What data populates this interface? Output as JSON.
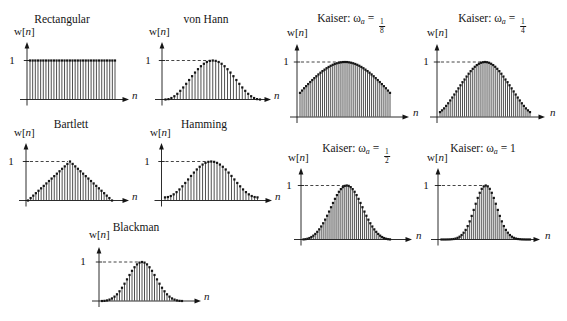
{
  "figure": {
    "background_color": "#ffffff",
    "ink_color": "#151515"
  },
  "chart_data": [
    {
      "id": "rectangular",
      "type": "stem",
      "title": {
        "pre": "Rectangular",
        "sub": "",
        "post": "",
        "frac_num": "",
        "frac_den": ""
      },
      "ylabel": {
        "pre": "w[",
        "var": "n",
        "post": "]"
      },
      "xlabel": "n",
      "ytick": "1",
      "ylim": [
        0,
        1
      ],
      "n_points": 33,
      "values": [
        1,
        1,
        1,
        1,
        1,
        1,
        1,
        1,
        1,
        1,
        1,
        1,
        1,
        1,
        1,
        1,
        1,
        1,
        1,
        1,
        1,
        1,
        1,
        1,
        1,
        1,
        1,
        1,
        1,
        1,
        1,
        1,
        1
      ]
    },
    {
      "id": "von-hann",
      "type": "stem",
      "title": {
        "pre": "von Hann",
        "sub": "",
        "post": "",
        "frac_num": "",
        "frac_den": ""
      },
      "ylabel": {
        "pre": "w[",
        "var": "n",
        "post": "]"
      },
      "xlabel": "n",
      "ytick": "1",
      "ylim": [
        0,
        1
      ],
      "n_points": 33,
      "values": [
        0,
        0.01,
        0.038,
        0.084,
        0.146,
        0.222,
        0.309,
        0.402,
        0.5,
        0.598,
        0.691,
        0.778,
        0.854,
        0.916,
        0.962,
        0.99,
        1,
        0.99,
        0.962,
        0.916,
        0.854,
        0.778,
        0.691,
        0.598,
        0.5,
        0.402,
        0.309,
        0.222,
        0.146,
        0.084,
        0.038,
        0.01,
        0
      ]
    },
    {
      "id": "kaiser-1-8",
      "type": "stem",
      "title": {
        "pre": "Kaiser: ω",
        "sub": "a",
        "post": " = ",
        "frac_num": "1",
        "frac_den": "8"
      },
      "ylabel": {
        "pre": "w[",
        "var": "n",
        "post": "]"
      },
      "xlabel": "n",
      "ytick": "1",
      "ylim": [
        0,
        1
      ],
      "n_points": 45,
      "values": [
        0.439,
        0.481,
        0.523,
        0.561,
        0.599,
        0.636,
        0.672,
        0.707,
        0.741,
        0.774,
        0.805,
        0.835,
        0.861,
        0.887,
        0.91,
        0.931,
        0.949,
        0.964,
        0.977,
        0.987,
        0.994,
        0.999,
        1,
        0.999,
        0.994,
        0.987,
        0.977,
        0.964,
        0.949,
        0.931,
        0.91,
        0.887,
        0.861,
        0.835,
        0.805,
        0.774,
        0.741,
        0.707,
        0.672,
        0.636,
        0.599,
        0.561,
        0.523,
        0.481,
        0.439
      ]
    },
    {
      "id": "kaiser-1-4",
      "type": "stem",
      "title": {
        "pre": "Kaiser: ω",
        "sub": "a",
        "post": " = ",
        "frac_num": "1",
        "frac_den": "4"
      },
      "ylabel": {
        "pre": "w[",
        "var": "n",
        "post": "]"
      },
      "xlabel": "n",
      "ytick": "1",
      "ylim": [
        0,
        1
      ],
      "n_points": 45,
      "values": [
        0.089,
        0.121,
        0.157,
        0.202,
        0.25,
        0.301,
        0.354,
        0.409,
        0.465,
        0.521,
        0.577,
        0.633,
        0.682,
        0.736,
        0.787,
        0.834,
        0.876,
        0.913,
        0.944,
        0.968,
        0.986,
        0.996,
        1,
        0.996,
        0.986,
        0.968,
        0.944,
        0.913,
        0.876,
        0.834,
        0.787,
        0.736,
        0.682,
        0.633,
        0.577,
        0.521,
        0.465,
        0.409,
        0.354,
        0.301,
        0.25,
        0.202,
        0.157,
        0.121,
        0.089
      ]
    },
    {
      "id": "bartlett",
      "type": "stem",
      "title": {
        "pre": "Bartlett",
        "sub": "",
        "post": "",
        "frac_num": "",
        "frac_den": ""
      },
      "ylabel": {
        "pre": "w[",
        "var": "n",
        "post": "]"
      },
      "xlabel": "n",
      "ytick": "1",
      "ylim": [
        0,
        1
      ],
      "n_points": 33,
      "values": [
        0,
        0.063,
        0.125,
        0.188,
        0.25,
        0.313,
        0.375,
        0.438,
        0.5,
        0.563,
        0.625,
        0.688,
        0.75,
        0.813,
        0.875,
        0.938,
        1,
        0.938,
        0.875,
        0.813,
        0.75,
        0.688,
        0.625,
        0.563,
        0.5,
        0.438,
        0.375,
        0.313,
        0.25,
        0.188,
        0.125,
        0.063,
        0
      ]
    },
    {
      "id": "hamming",
      "type": "stem",
      "title": {
        "pre": "Hamming",
        "sub": "",
        "post": "",
        "frac_num": "",
        "frac_den": ""
      },
      "ylabel": {
        "pre": "w[",
        "var": "n",
        "post": "]"
      },
      "xlabel": "n",
      "ytick": "1",
      "ylim": [
        0,
        1
      ],
      "n_points": 33,
      "values": [
        0.08,
        0.089,
        0.115,
        0.158,
        0.215,
        0.284,
        0.364,
        0.45,
        0.54,
        0.63,
        0.716,
        0.796,
        0.865,
        0.922,
        0.965,
        0.991,
        1,
        0.991,
        0.965,
        0.922,
        0.865,
        0.796,
        0.716,
        0.63,
        0.54,
        0.45,
        0.364,
        0.284,
        0.215,
        0.158,
        0.115,
        0.089,
        0.08
      ]
    },
    {
      "id": "kaiser-1-2",
      "type": "stem",
      "title": {
        "pre": "Kaiser: ω",
        "sub": "a",
        "post": " = ",
        "frac_num": "1",
        "frac_den": "2"
      },
      "ylabel": {
        "pre": "w[",
        "var": "n",
        "post": "]"
      },
      "xlabel": "n",
      "ytick": "1",
      "ylim": [
        0,
        1
      ],
      "n_points": 45,
      "values": [
        0.002,
        0.006,
        0.014,
        0.027,
        0.046,
        0.071,
        0.103,
        0.142,
        0.188,
        0.241,
        0.301,
        0.368,
        0.44,
        0.517,
        0.598,
        0.677,
        0.753,
        0.823,
        0.884,
        0.933,
        0.97,
        0.993,
        1,
        0.993,
        0.97,
        0.933,
        0.884,
        0.823,
        0.753,
        0.677,
        0.598,
        0.517,
        0.44,
        0.368,
        0.301,
        0.241,
        0.188,
        0.142,
        0.103,
        0.071,
        0.046,
        0.027,
        0.014,
        0.006,
        0.002
      ]
    },
    {
      "id": "kaiser-1",
      "type": "stem",
      "title": {
        "pre": "Kaiser: ω",
        "sub": "a",
        "post": " = 1",
        "frac_num": "",
        "frac_den": ""
      },
      "ylabel": {
        "pre": "w[",
        "var": "n",
        "post": "]"
      },
      "xlabel": "n",
      "ytick": "1",
      "ylim": [
        0,
        1
      ],
      "n_points": 45,
      "values": [
        0,
        0,
        0,
        0.001,
        0.002,
        0.005,
        0.009,
        0.017,
        0.031,
        0.052,
        0.083,
        0.126,
        0.178,
        0.249,
        0.336,
        0.437,
        0.548,
        0.662,
        0.77,
        0.865,
        0.938,
        0.984,
        1,
        0.984,
        0.938,
        0.865,
        0.77,
        0.662,
        0.548,
        0.437,
        0.336,
        0.249,
        0.178,
        0.126,
        0.083,
        0.052,
        0.031,
        0.017,
        0.009,
        0.005,
        0.002,
        0.001,
        0,
        0,
        0
      ]
    },
    {
      "id": "blackman",
      "type": "stem",
      "title": {
        "pre": "Blackman",
        "sub": "",
        "post": "",
        "frac_num": "",
        "frac_den": ""
      },
      "ylabel": {
        "pre": "w[",
        "var": "n",
        "post": "]"
      },
      "xlabel": "n",
      "ytick": "1",
      "ylim": [
        0,
        1
      ],
      "n_points": 33,
      "values": [
        0,
        0.004,
        0.015,
        0.036,
        0.066,
        0.112,
        0.172,
        0.249,
        0.34,
        0.444,
        0.555,
        0.667,
        0.774,
        0.866,
        0.939,
        0.984,
        1,
        0.984,
        0.939,
        0.866,
        0.774,
        0.667,
        0.555,
        0.444,
        0.34,
        0.249,
        0.172,
        0.112,
        0.066,
        0.036,
        0.015,
        0.004,
        0
      ]
    }
  ]
}
